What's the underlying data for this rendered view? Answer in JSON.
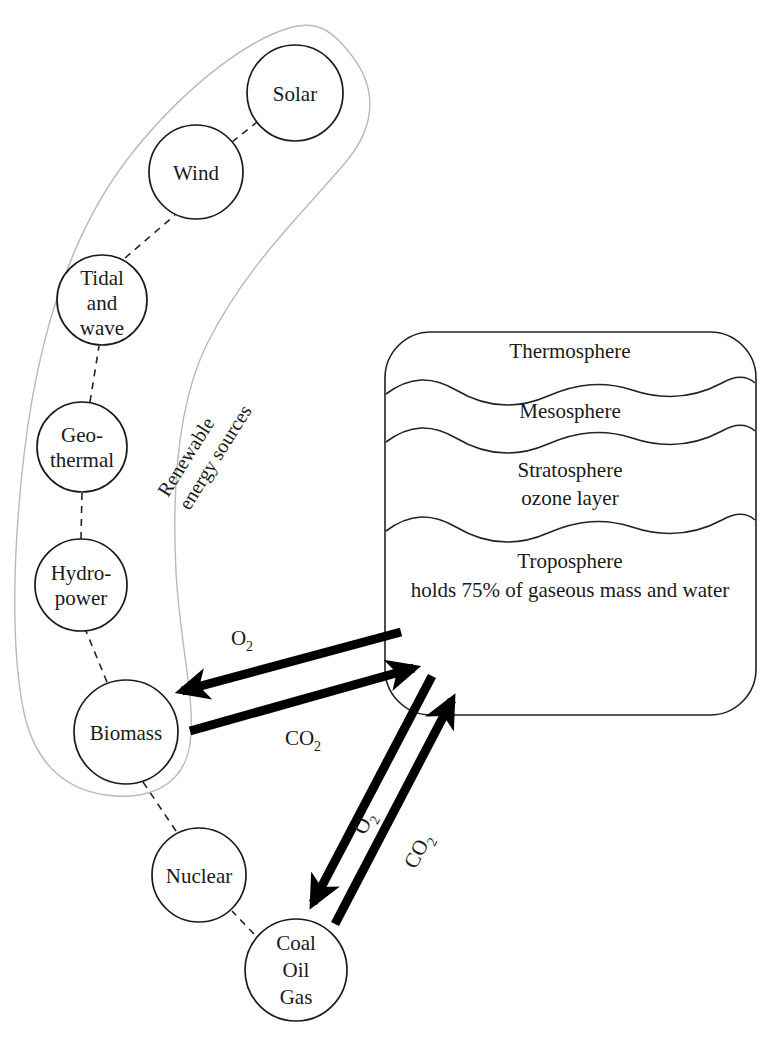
{
  "diagram": {
    "title_group": "Renewable energy sources",
    "nodes": [
      {
        "id": "solar",
        "lines": [
          "Solar"
        ],
        "cx": 295,
        "cy": 93,
        "r": 48
      },
      {
        "id": "wind",
        "lines": [
          "Wind"
        ],
        "cx": 196,
        "cy": 172,
        "r": 47
      },
      {
        "id": "tidal",
        "lines": [
          "Tidal",
          "and",
          "wave"
        ],
        "cx": 102,
        "cy": 300,
        "r": 45
      },
      {
        "id": "geothermal",
        "lines": [
          "Geo-",
          "thermal"
        ],
        "cx": 82,
        "cy": 447,
        "r": 45
      },
      {
        "id": "hydropower",
        "lines": [
          "Hydro-",
          "power"
        ],
        "cx": 81,
        "cy": 585,
        "r": 46
      },
      {
        "id": "biomass",
        "lines": [
          "Biomass"
        ],
        "cx": 126,
        "cy": 732,
        "r": 52
      },
      {
        "id": "nuclear",
        "lines": [
          "Nuclear"
        ],
        "cx": 199,
        "cy": 875,
        "r": 47
      },
      {
        "id": "fossil",
        "lines": [
          "Coal",
          "Oil",
          "Gas"
        ],
        "cx": 296,
        "cy": 970,
        "r": 51
      }
    ],
    "atmosphere": {
      "layers": [
        {
          "id": "thermosphere",
          "lines": [
            "Thermosphere"
          ]
        },
        {
          "id": "mesosphere",
          "lines": [
            "Mesosphere"
          ]
        },
        {
          "id": "stratosphere",
          "lines": [
            "Stratosphere",
            "ozone layer"
          ]
        },
        {
          "id": "troposphere",
          "lines": [
            "Troposphere",
            "holds 75% of gaseous mass and water"
          ]
        }
      ]
    },
    "flows": [
      {
        "id": "biomass-o2",
        "label": "O",
        "sub": "2",
        "from": "atmosphere",
        "to": "biomass"
      },
      {
        "id": "biomass-co2",
        "label": "CO",
        "sub": "2",
        "from": "biomass",
        "to": "atmosphere"
      },
      {
        "id": "fossil-o2",
        "label": "O",
        "sub": "2",
        "from": "atmosphere",
        "to": "fossil"
      },
      {
        "id": "fossil-co2",
        "label": "CO",
        "sub": "2",
        "from": "fossil",
        "to": "atmosphere"
      }
    ],
    "colors": {
      "ink": "#1a1a1a",
      "arrow": "#000000",
      "group_outline": "#b9b9b9",
      "background": "#ffffff"
    }
  }
}
